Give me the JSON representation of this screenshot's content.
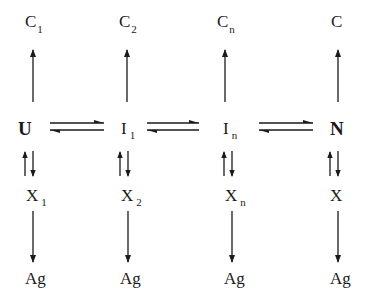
{
  "diagram": {
    "columns": [
      {
        "top": {
          "base": "C",
          "sub": "1"
        },
        "state": {
          "base": "U",
          "sub": "",
          "bold": true
        },
        "side": {
          "base": "X",
          "sub": "1"
        },
        "end": "Ag"
      },
      {
        "top": {
          "base": "C",
          "sub": "2"
        },
        "state": {
          "base": "I",
          "sub": "1",
          "bold": false
        },
        "side": {
          "base": "X",
          "sub": "2"
        },
        "end": "Ag"
      },
      {
        "top": {
          "base": "C",
          "sub": "n"
        },
        "state": {
          "base": "I",
          "sub": "n",
          "bold": false
        },
        "side": {
          "base": "X",
          "sub": "n"
        },
        "end": "Ag"
      },
      {
        "top": {
          "base": "C",
          "sub": ""
        },
        "state": {
          "base": "N",
          "sub": "",
          "bold": true
        },
        "side": {
          "base": "X",
          "sub": ""
        },
        "end": "Ag"
      }
    ],
    "edges": [
      {
        "from": "U",
        "to": "I1",
        "type": "reversible"
      },
      {
        "from": "I1",
        "to": "In",
        "type": "reversible"
      },
      {
        "from": "In",
        "to": "N",
        "type": "reversible"
      },
      {
        "from": "U",
        "to": "C1",
        "type": "irreversible"
      },
      {
        "from": "I1",
        "to": "C2",
        "type": "irreversible"
      },
      {
        "from": "In",
        "to": "Cn",
        "type": "irreversible"
      },
      {
        "from": "N",
        "to": "C",
        "type": "irreversible"
      },
      {
        "from": "U",
        "to": "X1",
        "type": "reversible"
      },
      {
        "from": "I1",
        "to": "X2",
        "type": "reversible"
      },
      {
        "from": "In",
        "to": "Xn",
        "type": "reversible"
      },
      {
        "from": "N",
        "to": "X",
        "type": "reversible"
      },
      {
        "from": "X1",
        "to": "Ag",
        "type": "irreversible"
      },
      {
        "from": "X2",
        "to": "Ag",
        "type": "irreversible"
      },
      {
        "from": "Xn",
        "to": "Ag",
        "type": "irreversible"
      },
      {
        "from": "X",
        "to": "Ag",
        "type": "irreversible"
      }
    ],
    "colors": {
      "ink": "#1a1a1a",
      "background": "#ffffff"
    }
  }
}
